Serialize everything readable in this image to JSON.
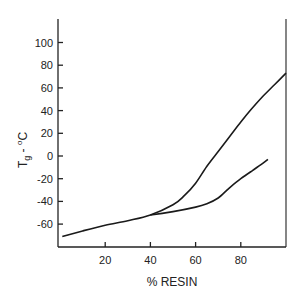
{
  "chart_data": {
    "type": "line",
    "title": "",
    "xlabel": "% RESIN",
    "ylabel": "Tg - °C",
    "ylabel_main": "T",
    "ylabel_sub": "g",
    "ylabel_rest": " - ",
    "ylabel_sup": "o",
    "ylabel_unit": "C",
    "xlim": [
      0,
      100
    ],
    "ylim": [
      -75,
      120
    ],
    "xticks": [
      20,
      40,
      60,
      80
    ],
    "xtick_labels": [
      "20",
      "40",
      "60",
      "80"
    ],
    "yticks": [
      100,
      80,
      60,
      40,
      20,
      0,
      -20,
      -40,
      -60
    ],
    "ytick_labels": [
      "100",
      "80",
      "60",
      "40",
      "20",
      "0",
      "-20",
      "-40",
      "-60"
    ],
    "grid": false,
    "legend": null,
    "series": [
      {
        "name": "upper curve",
        "x": [
          1,
          10,
          20,
          30,
          40,
          50,
          55,
          60,
          65,
          70,
          75,
          80,
          85,
          90,
          95,
          100
        ],
        "y": [
          -71,
          -66,
          -61,
          -57,
          -52,
          -43,
          -35,
          -24,
          -9,
          4,
          17,
          30,
          42,
          53,
          63,
          73
        ]
      },
      {
        "name": "lower curve",
        "x": [
          40,
          50,
          60,
          65,
          70,
          75,
          80,
          85,
          90,
          92
        ],
        "y": [
          -52,
          -49,
          -45,
          -42,
          -37,
          -28,
          -20,
          -13,
          -6,
          -3
        ]
      }
    ]
  }
}
